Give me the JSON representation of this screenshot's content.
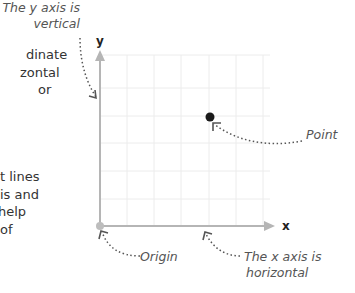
{
  "paragraph_fragments": {
    "top": [
      "dinate",
      "zontal",
      " or"
    ],
    "bottom": [
      "t lines",
      "is and",
      "help",
      " of"
    ]
  },
  "axes": {
    "x_label": "x",
    "y_label": "y",
    "color": "#b0b0b0"
  },
  "annotations": {
    "y_axis": [
      "The y axis is",
      "vertical"
    ],
    "point": "Point",
    "origin": "Origin",
    "x_axis": [
      "The x axis is",
      "horizontal"
    ]
  },
  "point": {
    "grid_x": 4,
    "grid_y": 4,
    "color": "#1a1a1a"
  },
  "grid": {
    "columns": 6,
    "rows": 7,
    "color": "#ececec"
  }
}
